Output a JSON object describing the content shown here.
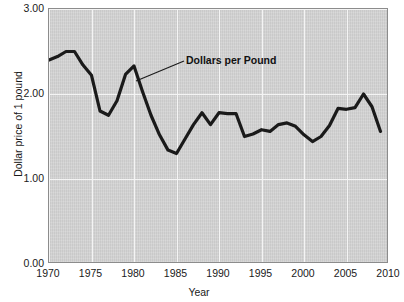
{
  "chart_data": {
    "type": "line",
    "title": "",
    "xlabel": "Year",
    "ylabel": "Dollar price of 1 pound",
    "xlim": [
      1970,
      2010
    ],
    "ylim": [
      0.0,
      3.0
    ],
    "xticks": [
      "1970",
      "1975",
      "1980",
      "1985",
      "1990",
      "1995",
      "2000",
      "2005",
      "2010"
    ],
    "xtick_values": [
      1970,
      1975,
      1980,
      1985,
      1990,
      1995,
      2000,
      2005,
      2010
    ],
    "yticks": [
      "0.00",
      "1.00",
      "2.00",
      "3.00"
    ],
    "ytick_values": [
      0.0,
      1.0,
      2.0,
      3.0
    ],
    "grid": "white gridlines at every x tick and y tick",
    "legend": "none",
    "annotations": [
      {
        "text": "Dollars per Pound",
        "points_to_x": 1979.3,
        "points_to_y": 2.15
      }
    ],
    "series": [
      {
        "name": "Dollars per Pound",
        "color": "#1a1a1a",
        "x": [
          1970,
          1971,
          1972,
          1973,
          1974,
          1975,
          1976,
          1977,
          1978,
          1979,
          1980,
          1981,
          1982,
          1983,
          1984,
          1985,
          1986,
          1987,
          1988,
          1989,
          1990,
          1991,
          1992,
          1993,
          1994,
          1995,
          1996,
          1997,
          1998,
          1999,
          2000,
          2001,
          2002,
          2003,
          2004,
          2005,
          2006,
          2007,
          2008,
          2009
        ],
        "values": [
          2.4,
          2.44,
          2.5,
          2.5,
          2.34,
          2.22,
          1.8,
          1.75,
          1.92,
          2.23,
          2.33,
          2.03,
          1.75,
          1.52,
          1.34,
          1.3,
          1.47,
          1.64,
          1.78,
          1.64,
          1.78,
          1.77,
          1.77,
          1.5,
          1.53,
          1.58,
          1.56,
          1.64,
          1.66,
          1.62,
          1.52,
          1.44,
          1.5,
          1.63,
          1.83,
          1.82,
          1.84,
          2.0,
          1.85,
          1.56
        ]
      }
    ]
  }
}
